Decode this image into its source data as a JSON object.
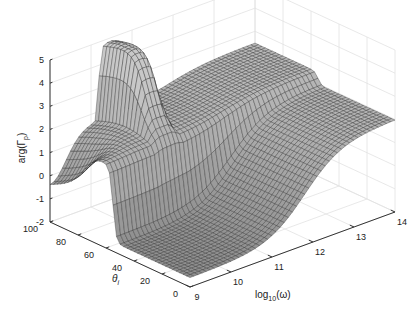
{
  "chart_data": {
    "type": "surface3d",
    "title": "",
    "xlabel": "log10(ω)",
    "xlabel_main": "log",
    "xlabel_sub": "10",
    "xlabel_tail": "(ω)",
    "ylabel": "θi",
    "ylabel_main": "θ",
    "ylabel_sub": "i",
    "zlabel": "arg(Γp)",
    "zlabel_main": "arg(Γ",
    "zlabel_sub": "p",
    "zlabel_tail": ")",
    "x_ticks": [
      "9",
      "10",
      "11",
      "12",
      "13",
      "14"
    ],
    "y_ticks": [
      "0",
      "20",
      "40",
      "60",
      "80",
      "100"
    ],
    "z_ticks": [
      "-2",
      "-1",
      "0",
      "1",
      "2",
      "3",
      "4",
      "5"
    ],
    "xlim": [
      9,
      14
    ],
    "ylim": [
      0,
      100
    ],
    "zlim": [
      -2,
      5
    ],
    "grid": true,
    "colormap": "gray mesh",
    "surface_samples": [
      {
        "theta": 0,
        "log_omega": [
          9,
          10,
          11,
          12,
          13,
          14
        ],
        "arg": [
          -1.6,
          -1.6,
          -1.2,
          0.5,
          1.6,
          1.8
        ]
      },
      {
        "theta": 50,
        "log_omega": [
          9,
          10,
          11,
          12,
          13,
          14
        ],
        "arg": [
          -1.5,
          -1.4,
          -0.8,
          0.8,
          2.0,
          2.2
        ]
      },
      {
        "theta": 60,
        "log_omega": [
          9,
          10,
          11,
          12,
          13,
          14
        ],
        "arg": [
          1.6,
          1.5,
          1.8,
          2.3,
          2.5,
          2.5
        ]
      },
      {
        "theta": 90,
        "log_omega": [
          9,
          10,
          10.5,
          11,
          12,
          14
        ],
        "arg": [
          -0.3,
          1.5,
          4.8,
          1.5,
          2.5,
          2.5
        ]
      }
    ]
  }
}
